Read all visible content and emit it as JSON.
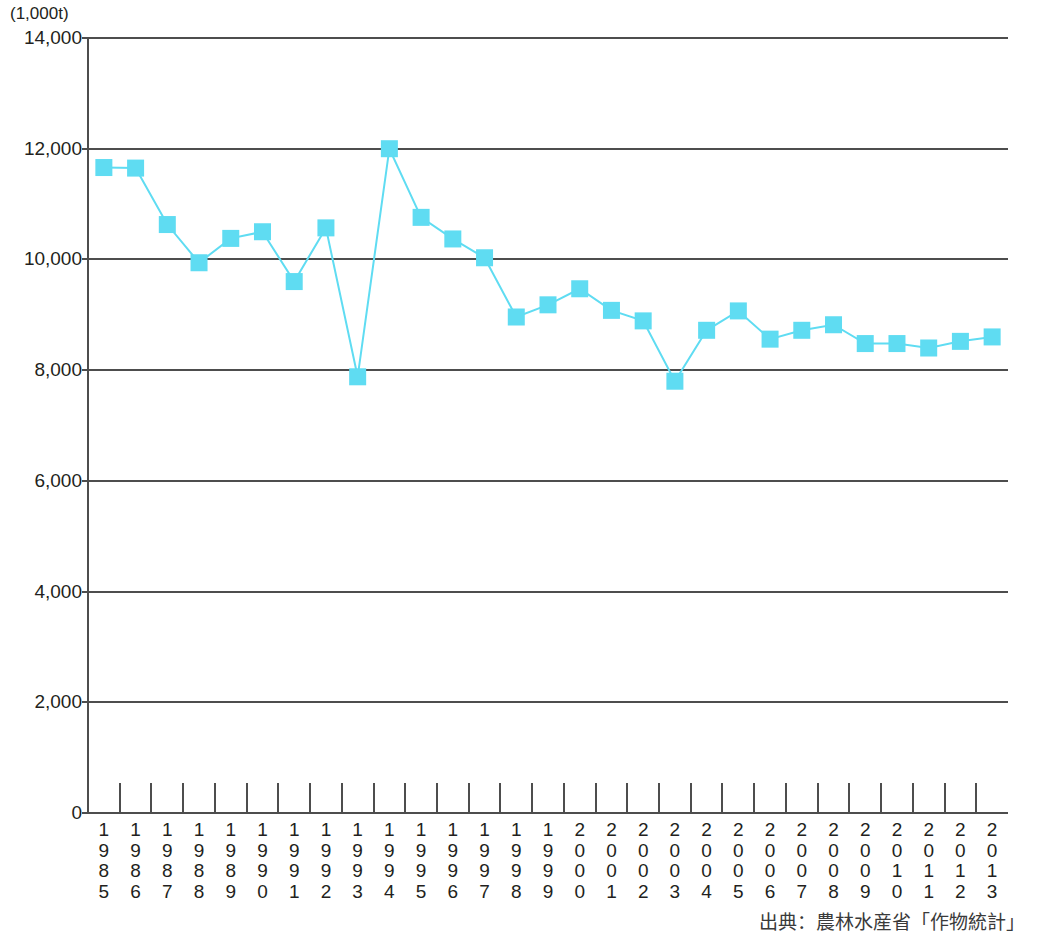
{
  "axis": {
    "unit_label": "(1,000t)",
    "y_ticks": [
      "14,000",
      "12,000",
      "10,000",
      "8,000",
      "6,000",
      "4,000",
      "2,000",
      "0"
    ]
  },
  "source": {
    "note": "出典：農林水産省「作物統計」"
  },
  "chart_data": {
    "type": "line",
    "title": "",
    "subtitle": "",
    "xlabel": "",
    "ylabel": "(1,000t)",
    "ylim": [
      0,
      14000
    ],
    "y_tick_values": [
      0,
      2000,
      4000,
      6000,
      8000,
      10000,
      12000,
      14000
    ],
    "grid": true,
    "legend": "none",
    "marker": "square",
    "series_color": "#5fdcf2",
    "categories": [
      "1985",
      "1986",
      "1987",
      "1988",
      "1989",
      "1990",
      "1991",
      "1992",
      "1993",
      "1994",
      "1995",
      "1996",
      "1997",
      "1998",
      "1999",
      "2000",
      "2001",
      "2002",
      "2003",
      "2004",
      "2005",
      "2006",
      "2007",
      "2008",
      "2009",
      "2010",
      "2011",
      "2012",
      "2013"
    ],
    "series": [
      {
        "name": "米の収穫量",
        "values": [
          11660,
          11650,
          10630,
          9940,
          10380,
          10500,
          9600,
          10570,
          7880,
          12000,
          10760,
          10370,
          10030,
          8960,
          9180,
          9470,
          9080,
          8890,
          7800,
          8720,
          9070,
          8560,
          8720,
          8820,
          8480,
          8480,
          8400,
          8520,
          8600
        ]
      }
    ]
  }
}
